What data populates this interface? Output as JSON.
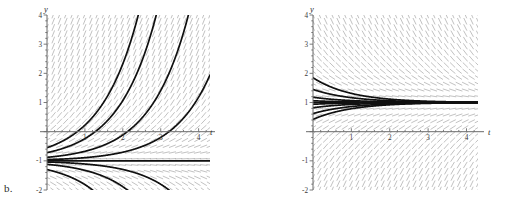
{
  "figure": {
    "background": "#ffffff",
    "width": 513,
    "height": 206,
    "panel_count": 2
  },
  "panels": [
    {
      "tag": "b.",
      "name": "panel-b",
      "xlabel": "t",
      "ylabel": "y",
      "xticks": [
        "1",
        "2",
        "3",
        "4"
      ],
      "yticks": [
        "4",
        "3",
        "2",
        "1",
        "-1",
        "-2"
      ],
      "xlim": [
        0,
        4.3
      ],
      "ylim": [
        -2,
        4
      ],
      "equilibrium": -1,
      "equilibrium_label": "y = -1",
      "field_color": "#8c8c8c",
      "curve_color": "#101010",
      "axis_color": "#6b6b6b"
    },
    {
      "tag": "c.",
      "name": "panel-c",
      "xlabel": "t",
      "ylabel": "y",
      "xticks": [
        "1",
        "2",
        "3",
        "4"
      ],
      "yticks": [
        "4",
        "3",
        "2",
        "1",
        "-1",
        "-2"
      ],
      "xlim": [
        0,
        4.3
      ],
      "ylim": [
        -2,
        4
      ],
      "equilibrium": 1,
      "equilibrium_label": "y = 1",
      "field_color": "#8c8c8c",
      "curve_color": "#101010",
      "axis_color": "#6b6b6b"
    }
  ],
  "chart_data": [
    {
      "type": "line",
      "name": "slope-field-b",
      "title": "",
      "xlabel": "t",
      "ylabel": "y",
      "xlim": [
        0,
        4.3
      ],
      "ylim": [
        -2,
        4
      ],
      "xticks": [
        1,
        2,
        3,
        4
      ],
      "yticks": [
        4,
        3,
        2,
        1,
        -1,
        -2
      ],
      "grid": false,
      "legend": "none",
      "description": "Direction field of dy/dt = y + 1 with unstable equilibrium y = -1; solutions above diverge upward, solutions below diverge downward.",
      "equilibrium_lines": [
        -1
      ],
      "series": [
        {
          "name": "solution-1",
          "y0": -0.55,
          "values_x": [
            0,
            0.5,
            1.0,
            1.5,
            2.0,
            2.4
          ],
          "values_y": [
            -0.55,
            -0.26,
            0.22,
            1.01,
            2.31,
            4.0
          ]
        },
        {
          "name": "solution-2",
          "y0": -0.72,
          "values_x": [
            0,
            0.5,
            1.0,
            1.5,
            2.0,
            2.5,
            2.8
          ],
          "values_y": [
            -0.72,
            -0.54,
            -0.24,
            0.25,
            1.05,
            2.37,
            4.0
          ]
        },
        {
          "name": "solution-3",
          "y0": -0.88,
          "values_x": [
            0,
            0.5,
            1.0,
            1.5,
            2.0,
            2.5,
            3.0,
            3.3
          ],
          "values_y": [
            -0.88,
            -0.8,
            -0.67,
            -0.45,
            -0.11,
            0.45,
            1.36,
            4.0
          ]
        },
        {
          "name": "solution-4",
          "y0": -1.0,
          "values_x": [
            0,
            1,
            2,
            3,
            4.3
          ],
          "values_y": [
            -1.0,
            -1.0,
            -1.0,
            -1.0,
            -1.0
          ]
        },
        {
          "name": "solution-5",
          "y0": -1.12,
          "values_x": [
            0,
            0.5,
            1.0,
            1.5,
            2.0,
            2.4
          ],
          "values_y": [
            -1.12,
            -1.2,
            -1.33,
            -1.54,
            -1.89,
            -2.0
          ]
        },
        {
          "name": "solution-6",
          "y0": -1.3,
          "values_x": [
            0,
            0.4,
            0.8,
            1.2,
            1.6,
            1.75
          ],
          "values_y": [
            -1.3,
            -1.45,
            -1.67,
            -2.0,
            -2.0,
            -2.0
          ]
        }
      ]
    },
    {
      "type": "line",
      "name": "slope-field-c",
      "title": "",
      "xlabel": "t",
      "ylabel": "y",
      "xlim": [
        0,
        4.3
      ],
      "ylim": [
        -2,
        4
      ],
      "xticks": [
        1,
        2,
        3,
        4
      ],
      "yticks": [
        4,
        3,
        2,
        1,
        -1,
        -2
      ],
      "grid": false,
      "legend": "none",
      "description": "Direction field of dy/dt = 1 - y with stable equilibrium y = 1; all solutions converge to y = 1.",
      "equilibrium_lines": [
        1
      ],
      "series": [
        {
          "name": "solution-1",
          "y0": 1.85,
          "values_x": [
            0,
            0.5,
            1.0,
            1.5,
            2.0,
            2.5,
            3.0,
            4.3
          ],
          "values_y": [
            1.85,
            1.52,
            1.31,
            1.19,
            1.11,
            1.07,
            1.04,
            1.01
          ]
        },
        {
          "name": "solution-2",
          "y0": 1.45,
          "values_x": [
            0,
            0.5,
            1.0,
            1.5,
            2.0,
            2.5,
            3.0,
            4.3
          ],
          "values_y": [
            1.45,
            1.27,
            1.17,
            1.1,
            1.06,
            1.04,
            1.02,
            1.0
          ]
        },
        {
          "name": "solution-3",
          "y0": 1.18,
          "values_x": [
            0,
            0.5,
            1.0,
            1.5,
            2.0,
            3.0,
            4.3
          ],
          "values_y": [
            1.18,
            1.11,
            1.07,
            1.04,
            1.02,
            1.01,
            1.0
          ]
        },
        {
          "name": "solution-4",
          "y0": 1.0,
          "values_x": [
            0,
            1,
            2,
            3,
            4.3
          ],
          "values_y": [
            1.0,
            1.0,
            1.0,
            1.0,
            1.0
          ]
        },
        {
          "name": "solution-5",
          "y0": 0.82,
          "values_x": [
            0,
            0.5,
            1.0,
            1.5,
            2.0,
            3.0,
            4.3
          ],
          "values_y": [
            0.82,
            0.89,
            0.93,
            0.96,
            0.98,
            0.99,
            1.0
          ]
        },
        {
          "name": "solution-6",
          "y0": 0.62,
          "values_x": [
            0,
            0.5,
            1.0,
            1.5,
            2.0,
            2.5,
            3.0,
            4.3
          ],
          "values_y": [
            0.62,
            0.77,
            0.86,
            0.91,
            0.95,
            0.97,
            0.98,
            1.0
          ]
        },
        {
          "name": "solution-7",
          "y0": 0.42,
          "values_x": [
            0,
            0.5,
            1.0,
            1.5,
            2.0,
            2.5,
            3.0,
            4.3
          ],
          "values_y": [
            0.42,
            0.65,
            0.79,
            0.87,
            0.92,
            0.95,
            0.97,
            1.0
          ]
        }
      ]
    }
  ]
}
